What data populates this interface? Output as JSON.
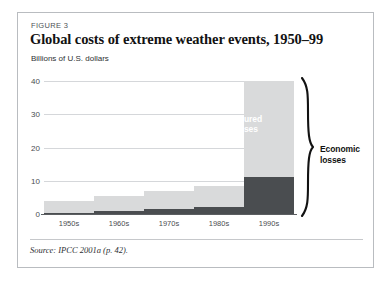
{
  "figure": {
    "kicker": "FIGURE 3",
    "title": "Global costs of extreme weather events, 1950–99",
    "source": "Source: IPCC 2001a (p. 42)."
  },
  "annotations": {
    "insured_losses": "Insured\nlosses",
    "insured_losses_line1": "Insured",
    "insured_losses_line2": "losses",
    "economic_losses_line1": "Economic",
    "economic_losses_line2": "losses",
    "brace_icon": "curly-brace-icon"
  },
  "colors": {
    "economic_bar": "#d9dadb",
    "insured_bar": "#4a4d50",
    "gridline": "#d5d7da",
    "axis": "#5b5e61",
    "frame_border": "#b9bcc0",
    "title_text": "#121212",
    "kicker_text": "#4e5256"
  },
  "chart_data": {
    "type": "bar",
    "title": "Global costs of extreme weather events, 1950–99",
    "subtitle": "FIGURE 3",
    "xlabel": "",
    "ylabel": "Billions of U.S. dollars",
    "categories": [
      "1950s",
      "1960s",
      "1970s",
      "1980s",
      "1990s"
    ],
    "yticks": [
      0,
      10,
      20,
      30,
      40
    ],
    "ylim": [
      0,
      40
    ],
    "grid": true,
    "legend_position": "in-chart-annotations",
    "stacked": false,
    "series": [
      {
        "name": "Economic losses",
        "color": "#d9dadb",
        "values": [
          4.0,
          5.5,
          7.0,
          8.5,
          40.0
        ]
      },
      {
        "name": "Insured losses",
        "color": "#4a4d50",
        "values": [
          0.2,
          1.0,
          1.5,
          2.2,
          11.0
        ]
      }
    ],
    "annotations": [
      "Economic losses",
      "Insured losses"
    ],
    "source": "Source: IPCC 2001a (p. 42)."
  }
}
